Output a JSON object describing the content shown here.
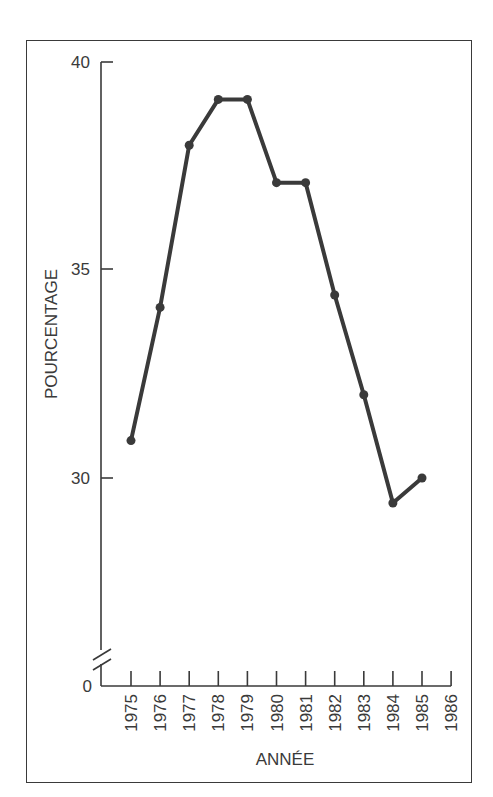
{
  "chart_data": {
    "type": "line",
    "title": "",
    "xlabel": "ANNÉE",
    "ylabel": "POURCENTAGE",
    "x": [
      1975,
      1976,
      1977,
      1978,
      1979,
      1980,
      1981,
      1982,
      1983,
      1984,
      1985
    ],
    "x_ticks": [
      "1975",
      "1976",
      "1977",
      "1978",
      "1979",
      "1980",
      "1981",
      "1982",
      "1983",
      "1984",
      "1985",
      "1986"
    ],
    "y_ticks": [
      "0",
      "30",
      "35",
      "40"
    ],
    "series": [
      {
        "name": "Pourcentage",
        "values": [
          30.9,
          34.1,
          38.0,
          39.1,
          39.1,
          37.1,
          37.1,
          34.4,
          32.0,
          29.4,
          30.0
        ]
      }
    ],
    "ylim": [
      0,
      40
    ],
    "axis_break": "between 0 and 30",
    "grid": false,
    "legend": "none",
    "colors": {
      "line": "#3a3a3a",
      "axis": "#3a3a3a",
      "frame": "#3a3a3a"
    }
  }
}
